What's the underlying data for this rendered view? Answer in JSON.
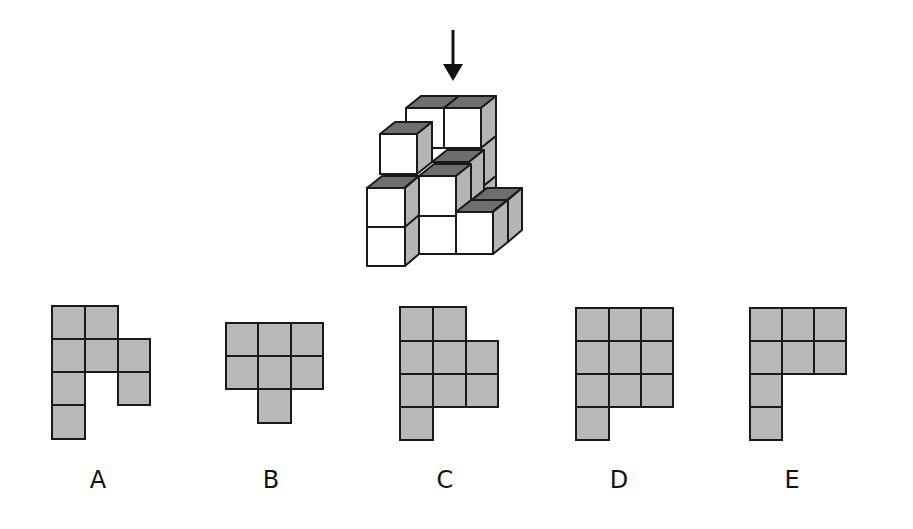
{
  "question": {
    "view_direction": "top (arrow pointing down)",
    "arrow_icon": "down-arrow"
  },
  "colors": {
    "face_front": "#ffffff",
    "face_top": "#6e6e6e",
    "face_side": "#b4b4b4",
    "option_fill": "#b9b9b9",
    "stroke": "#1a1a1a"
  },
  "options": [
    {
      "label": "A",
      "cells": [
        [
          0,
          0
        ],
        [
          1,
          0
        ],
        [
          0,
          1
        ],
        [
          1,
          1
        ],
        [
          2,
          1
        ],
        [
          0,
          2
        ],
        [
          2,
          2
        ],
        [
          0,
          3
        ]
      ]
    },
    {
      "label": "B",
      "cells": [
        [
          0,
          0
        ],
        [
          1,
          0
        ],
        [
          2,
          0
        ],
        [
          0,
          1
        ],
        [
          1,
          1
        ],
        [
          2,
          1
        ],
        [
          1,
          2
        ]
      ]
    },
    {
      "label": "C",
      "cells": [
        [
          0,
          0
        ],
        [
          1,
          0
        ],
        [
          0,
          1
        ],
        [
          1,
          1
        ],
        [
          2,
          1
        ],
        [
          0,
          2
        ],
        [
          1,
          2
        ],
        [
          2,
          2
        ],
        [
          0,
          3
        ]
      ]
    },
    {
      "label": "D",
      "cells": [
        [
          0,
          0
        ],
        [
          1,
          0
        ],
        [
          2,
          0
        ],
        [
          0,
          1
        ],
        [
          1,
          1
        ],
        [
          2,
          1
        ],
        [
          0,
          2
        ],
        [
          1,
          2
        ],
        [
          2,
          2
        ],
        [
          0,
          3
        ]
      ]
    },
    {
      "label": "E",
      "cells": [
        [
          0,
          0
        ],
        [
          1,
          0
        ],
        [
          2,
          0
        ],
        [
          0,
          1
        ],
        [
          1,
          1
        ],
        [
          2,
          1
        ],
        [
          0,
          2
        ],
        [
          0,
          3
        ]
      ]
    }
  ]
}
